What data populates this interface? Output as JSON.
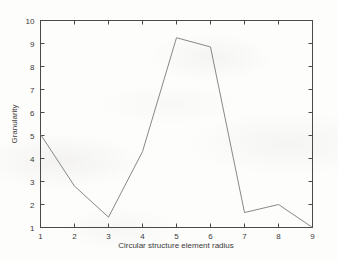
{
  "chart_data": {
    "type": "line",
    "title": "",
    "xlabel": "Circular structure element radius",
    "ylabel": "Granularity",
    "x": [
      1,
      2,
      3,
      4,
      5,
      6,
      7,
      8,
      9
    ],
    "values": [
      5.05,
      2.8,
      1.45,
      4.3,
      9.25,
      8.85,
      1.65,
      2.0,
      1.0
    ],
    "xlim": [
      1,
      9
    ],
    "ylim": [
      1,
      10
    ],
    "xticks": [
      1,
      2,
      3,
      4,
      5,
      6,
      7,
      8,
      9
    ],
    "yticks": [
      1,
      2,
      3,
      4,
      5,
      6,
      7,
      8,
      9,
      10
    ],
    "xtick_labels": [
      "1",
      "2",
      "3",
      "4",
      "5",
      "6",
      "7",
      "8",
      "9"
    ],
    "ytick_labels": [
      "1",
      "2",
      "3",
      "4",
      "5",
      "6",
      "7",
      "8",
      "9",
      "10"
    ],
    "grid": false,
    "legend": null,
    "series_color": "#7a7a7a",
    "axis_color": "#4a4a4a"
  }
}
